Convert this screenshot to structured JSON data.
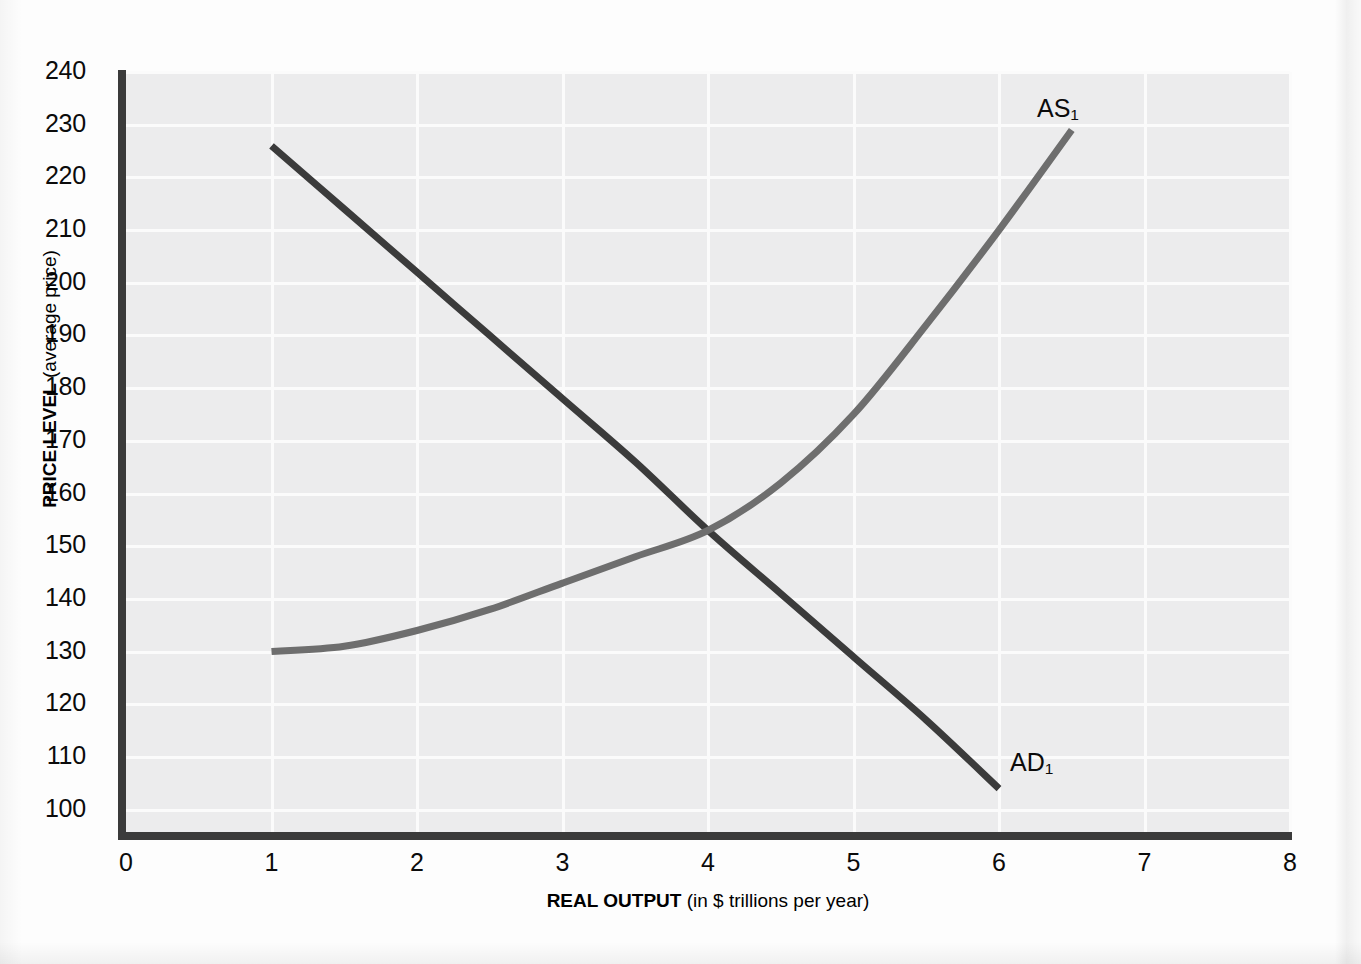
{
  "figure": {
    "background_color": "#ececed",
    "grid_color": "#fbfbfb",
    "axis_color": "#3b3b3b"
  },
  "axes": {
    "y_title_bold": "PRICE LEVEL",
    "y_title_rest": " (average price)",
    "x_title_bold": "REAL OUTPUT",
    "x_title_rest": " (in $ trillions per year)"
  },
  "chart_data": {
    "type": "line",
    "title": "",
    "subtitle": "",
    "xlabel": "REAL OUTPUT (in $ trillions per year)",
    "ylabel": "PRICE LEVEL (average price)",
    "xlim": [
      0,
      8
    ],
    "ylim": [
      95,
      240
    ],
    "grid": true,
    "legend_position": "inline-curve-labels",
    "xticks": [
      0,
      1,
      2,
      3,
      4,
      5,
      6,
      7,
      8
    ],
    "xtick_labels": [
      "0",
      "1",
      "2",
      "3",
      "4",
      "5",
      "6",
      "7",
      "8"
    ],
    "yticks": [
      100,
      110,
      120,
      130,
      140,
      150,
      160,
      170,
      180,
      190,
      200,
      210,
      220,
      230,
      240
    ],
    "ytick_labels": [
      "100",
      "110",
      "120",
      "130",
      "140",
      "150",
      "160",
      "170",
      "180",
      "190",
      "200",
      "210",
      "220",
      "230",
      "240"
    ],
    "equilibrium": {
      "x": 4.0,
      "y": 153
    },
    "series": [
      {
        "name": "AD1",
        "label_text": "AD",
        "label_sub": "1",
        "color": "#3b3b3b",
        "width": 7,
        "x": [
          1.0,
          1.5,
          2.0,
          2.5,
          3.0,
          3.5,
          4.0,
          4.5,
          5.0,
          5.5,
          6.0
        ],
        "values": [
          226,
          214,
          202,
          190,
          178,
          166,
          153,
          141,
          129,
          117,
          104
        ]
      },
      {
        "name": "AS1",
        "label_text": "AS",
        "label_sub": "1",
        "color": "#6e6e6e",
        "width": 7,
        "x": [
          1.0,
          1.5,
          2.0,
          2.5,
          3.0,
          3.5,
          4.0,
          4.5,
          5.0,
          5.5,
          6.0,
          6.5
        ],
        "values": [
          130,
          131,
          134,
          138,
          143,
          148,
          153,
          162,
          175,
          192,
          210,
          229
        ]
      }
    ]
  }
}
